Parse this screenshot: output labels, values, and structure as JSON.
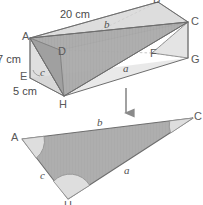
{
  "figure": {
    "colors": {
      "background": "#ffffff",
      "shade_fill": "#a8a8a8",
      "shade_fill_light": "#c6c6c6",
      "shade_fill_dark": "#9a9a9a",
      "edge": "#6e6e6e",
      "hidden_edge": "#b5b5b5",
      "text": "#4a4a4a",
      "arc_fill": "#dcdcdc",
      "arrow": "#8a8a8a"
    },
    "solid": {
      "name": "rectangular-prism",
      "vertices": [
        {
          "id": "A",
          "label": "A",
          "x": 30,
          "y": 38
        },
        {
          "id": "B",
          "label": "B",
          "x": 158,
          "y": 2
        },
        {
          "id": "C",
          "label": "C",
          "x": 188,
          "y": 22
        },
        {
          "id": "D",
          "label": "D",
          "x": 60,
          "y": 50
        },
        {
          "id": "E",
          "label": "E",
          "x": 30,
          "y": 78
        },
        {
          "id": "F",
          "label": "F",
          "x": 152,
          "y": 53
        },
        {
          "id": "G",
          "label": "G",
          "x": 188,
          "y": 58
        },
        {
          "id": "H",
          "label": "H",
          "x": 64,
          "y": 96
        }
      ],
      "dimensions": [
        {
          "id": "length",
          "label": "20 cm",
          "x": 60,
          "y": 10
        },
        {
          "id": "height",
          "label": "7 cm",
          "x": -2,
          "y": 52
        },
        {
          "id": "depth",
          "label": "5 cm",
          "x": 13,
          "y": 86
        }
      ],
      "side_labels": [
        {
          "id": "b",
          "label": "b",
          "x": 106,
          "y": 22
        },
        {
          "id": "a",
          "label": "a",
          "x": 125,
          "y": 66
        },
        {
          "id": "c",
          "label": "c",
          "x": 42,
          "y": 69
        }
      ]
    },
    "arrow": {
      "name": "transform-arrow",
      "label": "",
      "x1": 126,
      "y1": 88,
      "x2": 126,
      "y2": 116
    },
    "triangle": {
      "name": "planar-triangle-ACH",
      "vertices": [
        {
          "id": "A",
          "label": "A",
          "x": 22,
          "y": 139
        },
        {
          "id": "C",
          "label": "C",
          "x": 193,
          "y": 118
        },
        {
          "id": "H",
          "label": "H",
          "x": 68,
          "y": 199
        }
      ],
      "side_labels": [
        {
          "id": "b",
          "label": "b",
          "x": 99,
          "y": 120
        },
        {
          "id": "a",
          "label": "a",
          "x": 126,
          "y": 168
        },
        {
          "id": "c",
          "label": "c",
          "x": 42,
          "y": 173
        }
      ],
      "angles": [
        {
          "id": "angle-A",
          "vertex": "A"
        },
        {
          "id": "angle-C",
          "vertex": "C"
        },
        {
          "id": "angle-H",
          "vertex": "H"
        }
      ]
    }
  }
}
